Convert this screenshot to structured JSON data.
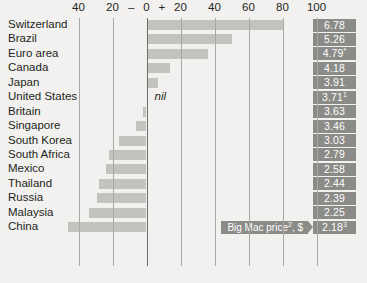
{
  "chart_data": {
    "type": "bar",
    "title": "",
    "subtitle": "",
    "xlabel": "",
    "ylabel": "",
    "orientation": "horizontal",
    "grid": true,
    "xlim": [
      -50,
      110
    ],
    "axis": {
      "ticks": [
        {
          "label": "40",
          "value": -40
        },
        {
          "label": "20",
          "value": -20
        },
        {
          "label": "0",
          "value": 0
        },
        {
          "label": "20",
          "value": 20
        },
        {
          "label": "40",
          "value": 40
        },
        {
          "label": "60",
          "value": 60
        },
        {
          "label": "80",
          "value": 80
        },
        {
          "label": "100",
          "value": 100
        }
      ],
      "minus_sign": "–",
      "plus_sign": "+"
    },
    "categories": [
      "Switzerland",
      "Brazil",
      "Euro area",
      "Canada",
      "Japan",
      "United States",
      "Britain",
      "Singapore",
      "South Korea",
      "South Africa",
      "Mexico",
      "Thailand",
      "Russia",
      "Malaysia",
      "China"
    ],
    "values": [
      81,
      50,
      36,
      14,
      7,
      0,
      -2,
      -6,
      -16,
      -22,
      -24,
      -28,
      -29,
      -34,
      -46
    ],
    "value_labels": [
      "6.78",
      "5.26",
      "4.79*",
      "4.18",
      "3.91",
      "3.71¹",
      "3.63",
      "3.46",
      "3.03",
      "2.79",
      "2.58",
      "2.44",
      "2.39",
      "2.25",
      "2.18³"
    ],
    "nil_annotation": "nil",
    "nil_row": "United States",
    "callout": "Big Mac price², $"
  },
  "rows": [
    {
      "label": "Switzerland",
      "value": 81,
      "badge": "6.78",
      "badge_sup": ""
    },
    {
      "label": "Brazil",
      "value": 50,
      "badge": "5.26",
      "badge_sup": ""
    },
    {
      "label": "Euro area",
      "value": 36,
      "badge": "4.79",
      "badge_sup": "*"
    },
    {
      "label": "Canada",
      "value": 14,
      "badge": "4.18",
      "badge_sup": ""
    },
    {
      "label": "Japan",
      "value": 7,
      "badge": "3.91",
      "badge_sup": ""
    },
    {
      "label": "United States",
      "value": 0,
      "badge": "3.71",
      "badge_sup": "1"
    },
    {
      "label": "Britain",
      "value": -2,
      "badge": "3.63",
      "badge_sup": ""
    },
    {
      "label": "Singapore",
      "value": -6,
      "badge": "3.46",
      "badge_sup": ""
    },
    {
      "label": "South Korea",
      "value": -16,
      "badge": "3.03",
      "badge_sup": ""
    },
    {
      "label": "South Africa",
      "value": -22,
      "badge": "2.79",
      "badge_sup": ""
    },
    {
      "label": "Mexico",
      "value": -24,
      "badge": "2.58",
      "badge_sup": ""
    },
    {
      "label": "Thailand",
      "value": -28,
      "badge": "2.44",
      "badge_sup": ""
    },
    {
      "label": "Russia",
      "value": -29,
      "badge": "2.39",
      "badge_sup": ""
    },
    {
      "label": "Malaysia",
      "value": -34,
      "badge": "2.25",
      "badge_sup": ""
    },
    {
      "label": "China",
      "value": -46,
      "badge": "2.18",
      "badge_sup": "3"
    }
  ],
  "callout": {
    "text": "Big Mac price",
    "sup": "2",
    "suffix": ", $"
  },
  "colors": {
    "background": "#f2f1ef",
    "bar": "#c2c2bf",
    "badge": "#8b8b88",
    "badge_text": "#ffffff",
    "gridline": "#a8a8a6",
    "zero_axis": "#6d6c6a",
    "text": "#231f20"
  }
}
